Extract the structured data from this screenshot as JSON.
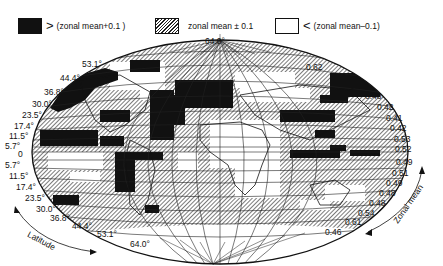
{
  "legend": [
    {
      "swatch": "black",
      "symbol": ">",
      "text": "(zonal mean+0.1 )"
    },
    {
      "swatch": "hatched",
      "symbol": "",
      "text": "zonal mean ± 0.1"
    },
    {
      "swatch": "white",
      "symbol": "<",
      "text": "(zonal mean–0.1)"
    }
  ],
  "latitude_labels_north": [
    "64.0°",
    "53.1°",
    "44.4°",
    "36.8°",
    "30.0°",
    "23.5°",
    "17.4°",
    "11.5°",
    "5.7°"
  ],
  "equator_label": "0",
  "latitude_labels_south": [
    "5.7°",
    "11.5°",
    "17.4°",
    "23.5°",
    "30.0°",
    "36.8°",
    "44.4°",
    "53.1°",
    "64.0°"
  ],
  "zonal_mean_north": [
    "0.62",
    "0.64",
    "0.55",
    "0.48",
    "0.42",
    "0.41",
    "0.42",
    "0.53",
    "0.52"
  ],
  "zonal_mean_south": [
    "0.49",
    "0.51",
    "0.49",
    "0.48",
    "0.48",
    "0.54",
    "0.61",
    "0.46"
  ],
  "axis_labels": {
    "latitude": "Latitude",
    "zonal_mean": "Zonal mean"
  },
  "colors": {
    "above": "#111111",
    "within": "hatched",
    "below": "#ffffff"
  }
}
